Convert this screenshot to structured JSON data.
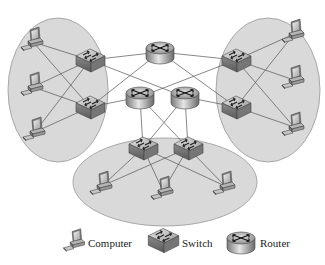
{
  "diagram": {
    "type": "network-topology",
    "colors": {
      "background": "#ffffff",
      "cluster_fill": "#d9d9d9",
      "cluster_stroke": "#a8a8a8",
      "link": "#555555",
      "device_body": "#a0a0a0"
    },
    "clusters": [
      {
        "id": "left",
        "cx": 58,
        "cy": 90,
        "rx": 50,
        "ry": 72
      },
      {
        "id": "right",
        "cx": 268,
        "cy": 90,
        "rx": 52,
        "ry": 72
      },
      {
        "id": "bottom",
        "cx": 165,
        "cy": 182,
        "rx": 92,
        "ry": 44
      }
    ],
    "nodes": {
      "routers": [
        {
          "id": "r_top",
          "x": 160,
          "y": 52
        },
        {
          "id": "r_midleft",
          "x": 140,
          "y": 97
        },
        {
          "id": "r_midright",
          "x": 185,
          "y": 97
        }
      ],
      "switches": [
        {
          "id": "s_l1",
          "x": 90,
          "y": 60
        },
        {
          "id": "s_l2",
          "x": 90,
          "y": 107
        },
        {
          "id": "s_r1",
          "x": 236,
          "y": 60
        },
        {
          "id": "s_r2",
          "x": 236,
          "y": 107
        },
        {
          "id": "s_b1",
          "x": 143,
          "y": 148
        },
        {
          "id": "s_b2",
          "x": 188,
          "y": 148
        }
      ],
      "computers": [
        {
          "id": "c_l1",
          "x": 33,
          "y": 42
        },
        {
          "id": "c_l2",
          "x": 33,
          "y": 87
        },
        {
          "id": "c_l3",
          "x": 35,
          "y": 132
        },
        {
          "id": "c_r1",
          "x": 294,
          "y": 34
        },
        {
          "id": "c_r2",
          "x": 294,
          "y": 80
        },
        {
          "id": "c_r3",
          "x": 294,
          "y": 127
        },
        {
          "id": "c_b1",
          "x": 102,
          "y": 186
        },
        {
          "id": "c_b2",
          "x": 163,
          "y": 191
        },
        {
          "id": "c_b3",
          "x": 225,
          "y": 186
        }
      ]
    },
    "links": [
      [
        "s_l1",
        "c_l1"
      ],
      [
        "s_l1",
        "c_l2"
      ],
      [
        "s_l1",
        "c_l3"
      ],
      [
        "s_l2",
        "c_l1"
      ],
      [
        "s_l2",
        "c_l2"
      ],
      [
        "s_l2",
        "c_l3"
      ],
      [
        "s_r1",
        "c_r1"
      ],
      [
        "s_r1",
        "c_r2"
      ],
      [
        "s_r1",
        "c_r3"
      ],
      [
        "s_r2",
        "c_r1"
      ],
      [
        "s_r2",
        "c_r3"
      ],
      [
        "s_b1",
        "c_b1"
      ],
      [
        "s_b1",
        "c_b2"
      ],
      [
        "s_b1",
        "c_b3"
      ],
      [
        "s_b2",
        "c_b1"
      ],
      [
        "s_b2",
        "c_b2"
      ],
      [
        "s_b2",
        "c_b3"
      ],
      [
        "s_l1",
        "r_top"
      ],
      [
        "r_top",
        "s_r1"
      ],
      [
        "s_l1",
        "r_midright"
      ],
      [
        "s_l2",
        "r_midleft"
      ],
      [
        "s_r1",
        "r_midleft"
      ],
      [
        "s_r2",
        "r_midright"
      ],
      [
        "r_top",
        "s_r2"
      ],
      [
        "r_top",
        "s_l2"
      ],
      [
        "r_midleft",
        "s_b1"
      ],
      [
        "r_midleft",
        "s_b2"
      ],
      [
        "r_midright",
        "s_b1"
      ],
      [
        "r_midright",
        "s_b2"
      ]
    ]
  },
  "legend": {
    "items": [
      {
        "icon": "computer-icon",
        "label": "Computer"
      },
      {
        "icon": "switch-icon",
        "label": "Switch"
      },
      {
        "icon": "router-icon",
        "label": "Router"
      }
    ]
  }
}
